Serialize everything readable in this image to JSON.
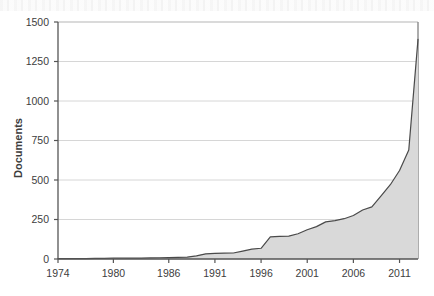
{
  "chart_data": {
    "type": "area",
    "title": "",
    "subtitle": "",
    "xlabel": "",
    "ylabel": "Documents",
    "xlim": [
      1974,
      2013
    ],
    "ylim": [
      0,
      1500
    ],
    "grid": true,
    "grid_axis": "y",
    "legend": false,
    "legend_position": "none",
    "fill_color": "#d9d9d9",
    "line_color": "#4a4a4a",
    "axis_color": "#555555",
    "grid_color": "#d6d6d6",
    "background_color": "#ffffff",
    "ytick_labels": [
      "0",
      "250",
      "500",
      "750",
      "1000",
      "1250",
      "1500"
    ],
    "ytick_values": [
      0,
      250,
      500,
      750,
      1000,
      1250,
      1500
    ],
    "xtick_labels": [
      "1974",
      "1980",
      "1986",
      "1991",
      "1996",
      "2001",
      "2006",
      "2011"
    ],
    "xtick_values": [
      1974,
      1980,
      1986,
      1991,
      1996,
      2001,
      2006,
      2011
    ],
    "series": [
      {
        "name": "Documents",
        "x": [
          1974,
          1975,
          1976,
          1977,
          1978,
          1979,
          1980,
          1981,
          1982,
          1983,
          1984,
          1985,
          1986,
          1987,
          1988,
          1989,
          1990,
          1991,
          1992,
          1993,
          1994,
          1995,
          1996,
          1997,
          1998,
          1999,
          2000,
          2001,
          2002,
          2003,
          2004,
          2005,
          2006,
          2007,
          2008,
          2009,
          2010,
          2011,
          2012,
          2013
        ],
        "values": [
          2,
          2,
          3,
          3,
          4,
          4,
          5,
          5,
          6,
          6,
          7,
          8,
          9,
          10,
          12,
          20,
          33,
          36,
          37,
          38,
          50,
          62,
          68,
          140,
          143,
          145,
          160,
          185,
          205,
          235,
          243,
          255,
          275,
          310,
          330,
          400,
          470,
          560,
          690,
          1390
        ]
      }
    ],
    "annotations": []
  }
}
